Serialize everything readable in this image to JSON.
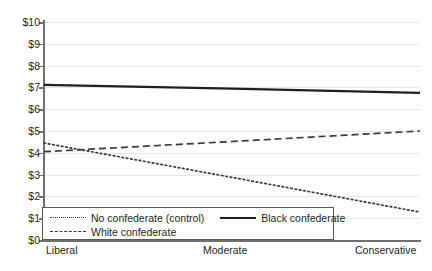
{
  "chart_data": {
    "type": "line",
    "title": "",
    "xlabel": "",
    "ylabel": "",
    "categories": [
      "Liberal",
      "Moderate",
      "Conservative"
    ],
    "x": [
      0,
      1,
      2
    ],
    "ylim": [
      0,
      10
    ],
    "yticks": [
      "$0",
      "$1",
      "$2",
      "$3",
      "$4",
      "$5",
      "$6",
      "$7",
      "$8",
      "$9",
      "$10"
    ],
    "ytick_values": [
      0,
      1,
      2,
      3,
      4,
      5,
      6,
      7,
      8,
      9,
      10
    ],
    "grid": true,
    "legend_position": "bottom-left-inside",
    "series": [
      {
        "name": "No confederate (control)",
        "style": "dotted",
        "color": "#3a3a3a",
        "values": [
          4.45,
          2.87,
          1.28
        ]
      },
      {
        "name": "Black confederate",
        "style": "solid",
        "color": "#231f20",
        "values": [
          7.12,
          6.94,
          6.75
        ]
      },
      {
        "name": "White confederate",
        "style": "dashed",
        "color": "#3a3a3a",
        "values": [
          4.05,
          4.52,
          5.0
        ]
      }
    ]
  },
  "axis": {
    "y_labels": [
      "$10",
      "$9",
      "$8",
      "$7",
      "$6",
      "$5",
      "$4",
      "$3",
      "$2",
      "$1",
      "$0"
    ],
    "x_labels": [
      "Liberal",
      "Moderate",
      "Conservative"
    ]
  },
  "legend": {
    "items": [
      {
        "label": "No confederate (control)",
        "style": "dotted"
      },
      {
        "label": "Black confederate",
        "style": "solid"
      },
      {
        "label": "White confederate",
        "style": "dashed"
      }
    ]
  }
}
